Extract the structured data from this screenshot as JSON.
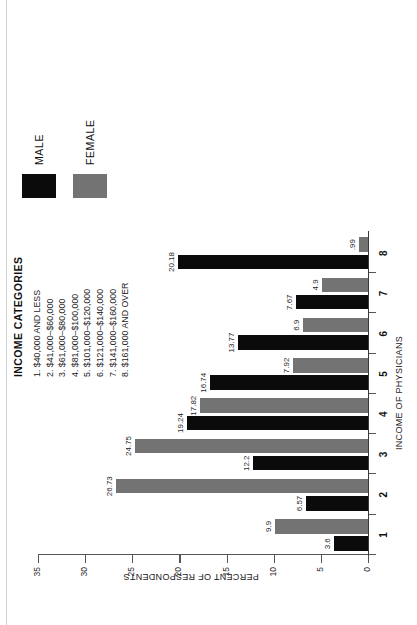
{
  "chart_data": {
    "type": "bar",
    "title": "",
    "xlabel": "INCOME OF PHYSICIANS",
    "ylabel": "PERCENT OF RESPONDENTS",
    "ylim": [
      0,
      35
    ],
    "yticks": [
      0,
      5,
      10,
      15,
      20,
      25,
      30,
      35
    ],
    "ytick_labels": [
      "0",
      "5",
      "10",
      "15",
      "20",
      "25",
      "30",
      "35"
    ],
    "categories": [
      "1",
      "2",
      "3",
      "4",
      "5",
      "6",
      "7",
      "8"
    ],
    "grid": false,
    "legend_position": "right",
    "orientation": "vertical-bars-rotated-90ccw",
    "series": [
      {
        "name": "MALE",
        "color": "#0b0b0b",
        "values": [
          3.6,
          6.57,
          12.2,
          19.24,
          16.74,
          13.77,
          7.67,
          20.18
        ],
        "value_labels": [
          "3.6",
          "6.57",
          "12.2",
          "19.24",
          "16.74",
          "13.77",
          "7.67",
          "20.18"
        ]
      },
      {
        "name": "FEMALE",
        "color": "#737373",
        "values": [
          9.9,
          26.73,
          24.75,
          17.82,
          7.92,
          6.9,
          4.9,
          0.99
        ],
        "value_labels": [
          "9.9",
          "26.73",
          "24.75",
          "17.82",
          "7.92",
          "6.9",
          "4.9",
          ".99"
        ]
      }
    ]
  },
  "legend": {
    "items": [
      {
        "label": "MALE",
        "color": "#0b0b0b"
      },
      {
        "label": "FEMALE",
        "color": "#737373"
      }
    ]
  },
  "key": {
    "title": "INCOME CATEGORIES",
    "items": [
      "1. $40,000 AND LESS",
      "2. $41,000–$60,000",
      "3. $61,000–$80,000",
      "4. $81,000–$100,000",
      "5. $101,000–$120,000",
      "6. $121,000–$140,000",
      "7. $141,000–$160,000",
      "8. $161,000 AND OVER"
    ]
  }
}
